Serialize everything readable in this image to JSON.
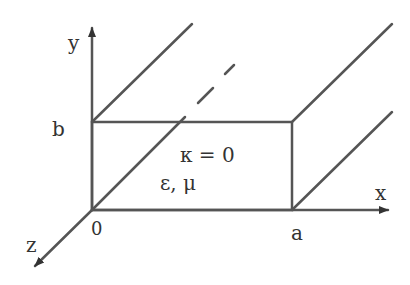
{
  "diagram": {
    "axes": {
      "x_label": "x",
      "y_label": "y",
      "z_label": "z",
      "origin_label": "0"
    },
    "dimensions": {
      "width_label": "a",
      "height_label": "b"
    },
    "interior": {
      "conductivity": "κ = 0",
      "material": "ε, μ"
    },
    "colors": {
      "line": "#555555",
      "text": "#333333",
      "background": "#ffffff"
    }
  }
}
